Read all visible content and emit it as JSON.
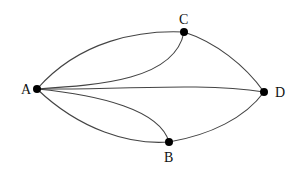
{
  "diagram": {
    "type": "multigraph",
    "nodes": [
      {
        "id": "A",
        "label": "A",
        "x": 37,
        "y": 89
      },
      {
        "id": "C",
        "label": "C",
        "x": 184,
        "y": 32
      },
      {
        "id": "D",
        "label": "D",
        "x": 264,
        "y": 92
      },
      {
        "id": "B",
        "label": "B",
        "x": 169,
        "y": 142
      }
    ],
    "edges": [
      {
        "from": "A",
        "to": "C"
      },
      {
        "from": "A",
        "to": "C"
      },
      {
        "from": "A",
        "to": "D"
      },
      {
        "from": "A",
        "to": "B"
      },
      {
        "from": "A",
        "to": "B"
      },
      {
        "from": "C",
        "to": "D"
      },
      {
        "from": "B",
        "to": "D"
      }
    ]
  }
}
